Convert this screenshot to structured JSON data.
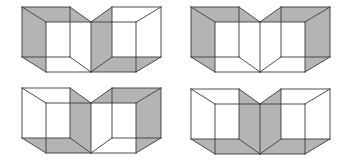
{
  "diagram": {
    "title": "",
    "colors": {
      "shade": "#b4b4b4",
      "line": "#3a3a3a",
      "background": "#ffffff"
    },
    "geometry": {
      "vertices_note": "relative to figure origin",
      "faces": {
        "L-left": [
          [
            0,
            0
          ],
          [
            24,
            15
          ],
          [
            24,
            65
          ],
          [
            0,
            50
          ]
        ],
        "L-top": [
          [
            0,
            0
          ],
          [
            48,
            0
          ],
          [
            69,
            15
          ],
          [
            24,
            15
          ]
        ],
        "L-bottom": [
          [
            0,
            50
          ],
          [
            48,
            50
          ],
          [
            69,
            65
          ],
          [
            24,
            65
          ]
        ],
        "L-right": [
          [
            48,
            0
          ],
          [
            69,
            15
          ],
          [
            69,
            65
          ],
          [
            48,
            50
          ]
        ],
        "R-left": [
          [
            90,
            0
          ],
          [
            69,
            15
          ],
          [
            69,
            65
          ],
          [
            90,
            50
          ]
        ],
        "R-top": [
          [
            90,
            0
          ],
          [
            139,
            0
          ],
          [
            114,
            15
          ],
          [
            69,
            15
          ]
        ],
        "R-bottom": [
          [
            90,
            50
          ],
          [
            139,
            50
          ],
          [
            114,
            65
          ],
          [
            69,
            65
          ]
        ],
        "R-right": [
          [
            139,
            0
          ],
          [
            114,
            15
          ],
          [
            114,
            65
          ],
          [
            139,
            50
          ]
        ]
      },
      "edges": [
        [
          [
            0,
            0
          ],
          [
            48,
            0
          ]
        ],
        [
          [
            48,
            0
          ],
          [
            48,
            50
          ]
        ],
        [
          [
            48,
            50
          ],
          [
            0,
            50
          ]
        ],
        [
          [
            0,
            50
          ],
          [
            0,
            0
          ]
        ],
        [
          [
            24,
            15
          ],
          [
            69,
            15
          ]
        ],
        [
          [
            69,
            15
          ],
          [
            69,
            65
          ]
        ],
        [
          [
            69,
            65
          ],
          [
            24,
            65
          ]
        ],
        [
          [
            24,
            65
          ],
          [
            24,
            15
          ]
        ],
        [
          [
            0,
            0
          ],
          [
            24,
            15
          ]
        ],
        [
          [
            48,
            0
          ],
          [
            69,
            15
          ]
        ],
        [
          [
            0,
            50
          ],
          [
            24,
            65
          ]
        ],
        [
          [
            48,
            50
          ],
          [
            69,
            65
          ]
        ],
        [
          [
            90,
            0
          ],
          [
            139,
            0
          ]
        ],
        [
          [
            139,
            0
          ],
          [
            139,
            50
          ]
        ],
        [
          [
            139,
            50
          ],
          [
            90,
            50
          ]
        ],
        [
          [
            90,
            50
          ],
          [
            90,
            0
          ]
        ],
        [
          [
            69,
            15
          ],
          [
            114,
            15
          ]
        ],
        [
          [
            114,
            15
          ],
          [
            114,
            65
          ]
        ],
        [
          [
            114,
            65
          ],
          [
            69,
            65
          ]
        ],
        [
          [
            90,
            0
          ],
          [
            69,
            15
          ]
        ],
        [
          [
            139,
            0
          ],
          [
            114,
            15
          ]
        ],
        [
          [
            90,
            50
          ],
          [
            69,
            65
          ]
        ],
        [
          [
            139,
            50
          ],
          [
            114,
            65
          ]
        ]
      ]
    },
    "figures": [
      {
        "id": "figure-1",
        "position": "top-left",
        "origin": [
          22,
          7
        ],
        "shaded_faces": [
          "L-left",
          "L-top",
          "R-left",
          "R-bottom"
        ]
      },
      {
        "id": "figure-2",
        "position": "top-right",
        "origin": [
          191,
          7
        ],
        "shaded_faces": [
          "L-left",
          "L-top",
          "R-top",
          "R-right"
        ]
      },
      {
        "id": "figure-3",
        "position": "bottom-left",
        "origin": [
          22,
          88
        ],
        "shaded_faces": [
          "L-right",
          "L-bottom",
          "R-top",
          "R-right"
        ]
      },
      {
        "id": "figure-4",
        "position": "bottom-right",
        "origin": [
          191,
          89
        ],
        "shaded_faces": [
          "L-right",
          "L-bottom",
          "R-left",
          "R-bottom"
        ]
      }
    ]
  }
}
